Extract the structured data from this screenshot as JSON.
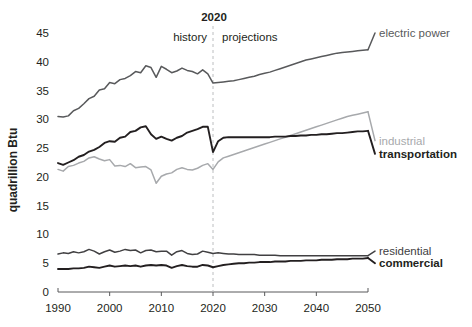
{
  "chart_data": {
    "type": "line",
    "title": "",
    "xlabel": "",
    "ylabel": "quadrillion Btu",
    "xlim": [
      1990,
      2050
    ],
    "ylim": [
      0,
      45
    ],
    "yticks": [
      0,
      5,
      10,
      15,
      20,
      25,
      30,
      35,
      40,
      45
    ],
    "xticks": [
      1990,
      2000,
      2010,
      2020,
      2030,
      2040,
      2050
    ],
    "grid": false,
    "legend_position": "right-inline",
    "annotations": {
      "divider_year": 2020,
      "divider_label": "2020",
      "left_label": "history",
      "right_label": "projections"
    },
    "colors": {
      "electric_power": "#58595b",
      "industrial": "#a7a9ac",
      "transportation": "#231f20",
      "residential": "#414042",
      "commercial": "#231f20",
      "axis": "#58595b",
      "divider": "#bcbec0",
      "text": "#231f20"
    },
    "series": [
      {
        "name": "electric power",
        "label": "electric power",
        "color": "#58595b",
        "bold_label": false,
        "label_color": "#58595b",
        "label_y": 45,
        "x": [
          1990,
          1991,
          1992,
          1993,
          1994,
          1995,
          1996,
          1997,
          1998,
          1999,
          2000,
          2001,
          2002,
          2003,
          2004,
          2005,
          2006,
          2007,
          2008,
          2009,
          2010,
          2011,
          2012,
          2013,
          2014,
          2015,
          2016,
          2017,
          2018,
          2019,
          2020,
          2021,
          2022,
          2023,
          2024,
          2025,
          2026,
          2027,
          2028,
          2029,
          2030,
          2031,
          2032,
          2033,
          2034,
          2035,
          2036,
          2037,
          2038,
          2039,
          2040,
          2041,
          2042,
          2043,
          2044,
          2045,
          2046,
          2047,
          2048,
          2049,
          2050
        ],
        "y": [
          30.5,
          30.4,
          30.6,
          31.5,
          31.9,
          32.7,
          33.6,
          34.0,
          35.1,
          35.3,
          36.4,
          36.2,
          36.9,
          37.1,
          37.6,
          38.3,
          38.1,
          39.3,
          39.0,
          37.3,
          39.2,
          38.7,
          38.1,
          38.4,
          38.9,
          38.5,
          38.3,
          37.9,
          38.6,
          37.9,
          36.3,
          36.4,
          36.5,
          36.6,
          36.7,
          36.9,
          37.1,
          37.3,
          37.5,
          37.8,
          38.0,
          38.2,
          38.5,
          38.8,
          39.1,
          39.4,
          39.7,
          40.0,
          40.3,
          40.5,
          40.7,
          40.9,
          41.1,
          41.3,
          41.5,
          41.6,
          41.7,
          41.8,
          41.9,
          42.0,
          42.1
        ]
      },
      {
        "name": "industrial",
        "label": "industrial",
        "color": "#a7a9ac",
        "bold_label": false,
        "label_color": "#a7a9ac",
        "label_y": 26.3,
        "x": [
          1990,
          1991,
          1992,
          1993,
          1994,
          1995,
          1996,
          1997,
          1998,
          1999,
          2000,
          2001,
          2002,
          2003,
          2004,
          2005,
          2006,
          2007,
          2008,
          2009,
          2010,
          2011,
          2012,
          2013,
          2014,
          2015,
          2016,
          2017,
          2018,
          2019,
          2020,
          2021,
          2022,
          2023,
          2024,
          2025,
          2026,
          2027,
          2028,
          2029,
          2030,
          2031,
          2032,
          2033,
          2034,
          2035,
          2036,
          2037,
          2038,
          2039,
          2040,
          2041,
          2042,
          2043,
          2044,
          2045,
          2046,
          2047,
          2048,
          2049,
          2050
        ],
        "y": [
          21.3,
          21.0,
          21.8,
          22.0,
          22.4,
          22.7,
          23.3,
          23.5,
          23.1,
          22.8,
          23.0,
          21.9,
          22.0,
          21.8,
          22.3,
          21.6,
          21.7,
          21.8,
          21.2,
          18.9,
          20.1,
          20.5,
          20.7,
          21.3,
          21.6,
          21.3,
          21.2,
          21.5,
          22.0,
          22.3,
          21.3,
          22.6,
          23.3,
          23.6,
          23.9,
          24.2,
          24.5,
          24.8,
          25.1,
          25.4,
          25.7,
          26.0,
          26.3,
          26.6,
          26.9,
          27.2,
          27.5,
          27.8,
          28.1,
          28.4,
          28.7,
          29.0,
          29.3,
          29.6,
          29.9,
          30.2,
          30.5,
          30.7,
          30.9,
          31.1,
          31.3
        ]
      },
      {
        "name": "transportation",
        "label": "transportation",
        "color": "#231f20",
        "bold_label": true,
        "label_color": "#231f20",
        "label_y": 24.0,
        "x": [
          1990,
          1991,
          1992,
          1993,
          1994,
          1995,
          1996,
          1997,
          1998,
          1999,
          2000,
          2001,
          2002,
          2003,
          2004,
          2005,
          2006,
          2007,
          2008,
          2009,
          2010,
          2011,
          2012,
          2013,
          2014,
          2015,
          2016,
          2017,
          2018,
          2019,
          2020,
          2021,
          2022,
          2023,
          2024,
          2025,
          2026,
          2027,
          2028,
          2029,
          2030,
          2031,
          2032,
          2033,
          2034,
          2035,
          2036,
          2037,
          2038,
          2039,
          2040,
          2041,
          2042,
          2043,
          2044,
          2045,
          2046,
          2047,
          2048,
          2049,
          2050
        ],
        "y": [
          22.4,
          22.1,
          22.5,
          22.9,
          23.5,
          23.8,
          24.4,
          24.7,
          25.2,
          25.9,
          26.2,
          26.1,
          26.8,
          27.0,
          27.8,
          28.0,
          28.6,
          28.8,
          27.4,
          26.6,
          27.0,
          26.6,
          26.3,
          26.8,
          27.1,
          27.7,
          28.0,
          28.3,
          28.7,
          28.7,
          24.3,
          26.2,
          26.8,
          26.9,
          26.9,
          26.9,
          26.9,
          26.9,
          26.9,
          26.9,
          26.9,
          26.9,
          27.0,
          27.0,
          27.0,
          27.1,
          27.1,
          27.2,
          27.2,
          27.3,
          27.3,
          27.4,
          27.4,
          27.5,
          27.6,
          27.6,
          27.7,
          27.8,
          27.9,
          27.9,
          28.0
        ]
      },
      {
        "name": "residential",
        "label": "residential",
        "color": "#414042",
        "bold_label": false,
        "label_color": "#414042",
        "label_y": 7.1,
        "x": [
          1990,
          1991,
          1992,
          1993,
          1994,
          1995,
          1996,
          1997,
          1998,
          1999,
          2000,
          2001,
          2002,
          2003,
          2004,
          2005,
          2006,
          2007,
          2008,
          2009,
          2010,
          2011,
          2012,
          2013,
          2014,
          2015,
          2016,
          2017,
          2018,
          2019,
          2020,
          2021,
          2022,
          2023,
          2024,
          2025,
          2026,
          2027,
          2028,
          2029,
          2030,
          2031,
          2032,
          2033,
          2034,
          2035,
          2036,
          2037,
          2038,
          2039,
          2040,
          2041,
          2042,
          2043,
          2044,
          2045,
          2046,
          2047,
          2048,
          2049,
          2050
        ],
        "y": [
          6.6,
          6.8,
          6.7,
          7.0,
          6.8,
          7.0,
          7.4,
          7.1,
          6.6,
          7.0,
          7.3,
          6.9,
          7.1,
          7.4,
          7.2,
          7.3,
          6.8,
          7.2,
          7.3,
          7.0,
          7.1,
          7.1,
          6.4,
          7.0,
          7.2,
          6.7,
          6.5,
          6.6,
          7.1,
          6.9,
          6.7,
          6.8,
          6.7,
          6.6,
          6.6,
          6.5,
          6.5,
          6.5,
          6.5,
          6.4,
          6.4,
          6.4,
          6.4,
          6.3,
          6.3,
          6.3,
          6.3,
          6.3,
          6.3,
          6.3,
          6.3,
          6.3,
          6.3,
          6.3,
          6.3,
          6.3,
          6.3,
          6.3,
          6.3,
          6.3,
          6.3
        ]
      },
      {
        "name": "commercial",
        "label": "commercial",
        "color": "#231f20",
        "bold_label": true,
        "label_color": "#231f20",
        "label_y": 5.0,
        "x": [
          1990,
          1991,
          1992,
          1993,
          1994,
          1995,
          1996,
          1997,
          1998,
          1999,
          2000,
          2001,
          2002,
          2003,
          2004,
          2005,
          2006,
          2007,
          2008,
          2009,
          2010,
          2011,
          2012,
          2013,
          2014,
          2015,
          2016,
          2017,
          2018,
          2019,
          2020,
          2021,
          2022,
          2023,
          2024,
          2025,
          2026,
          2027,
          2028,
          2029,
          2030,
          2031,
          2032,
          2033,
          2034,
          2035,
          2036,
          2037,
          2038,
          2039,
          2040,
          2041,
          2042,
          2043,
          2044,
          2045,
          2046,
          2047,
          2048,
          2049,
          2050
        ],
        "y": [
          4.0,
          4.0,
          4.0,
          4.1,
          4.1,
          4.2,
          4.4,
          4.3,
          4.2,
          4.4,
          4.6,
          4.4,
          4.5,
          4.6,
          4.5,
          4.6,
          4.4,
          4.6,
          4.7,
          4.6,
          4.7,
          4.6,
          4.2,
          4.5,
          4.7,
          4.5,
          4.4,
          4.4,
          4.7,
          4.6,
          4.3,
          4.5,
          4.7,
          4.8,
          4.9,
          5.0,
          5.0,
          5.1,
          5.1,
          5.2,
          5.2,
          5.2,
          5.3,
          5.3,
          5.3,
          5.4,
          5.4,
          5.4,
          5.5,
          5.5,
          5.5,
          5.6,
          5.6,
          5.6,
          5.7,
          5.7,
          5.7,
          5.8,
          5.8,
          5.8,
          5.9
        ]
      }
    ]
  }
}
